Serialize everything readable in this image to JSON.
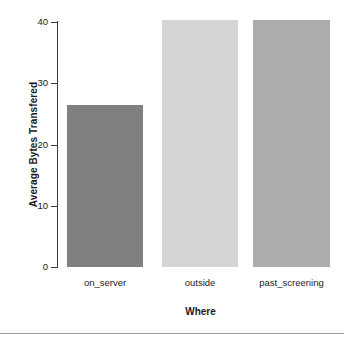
{
  "chart_data": {
    "type": "bar",
    "title": "",
    "subtitle": "",
    "xlabel": "Where",
    "ylabel": "Average Bytes Transfered",
    "categories": [
      "on_server",
      "outside",
      "past_screening"
    ],
    "values": [
      26.5,
      40.4,
      40.4
    ],
    "series": [
      {
        "name": "Average Bytes Transfered",
        "values": [
          26.5,
          40.4,
          40.4
        ]
      }
    ],
    "bar_colors": [
      "#808080",
      "#d5d5d5",
      "#acacac"
    ],
    "ylim": [
      0,
      40
    ],
    "y_ticks": [
      0,
      10,
      20,
      30,
      40
    ],
    "y_tick_labels": [
      "0",
      "10",
      "20",
      "30",
      "40"
    ],
    "x_tick_labels": [
      "on_server",
      "outside",
      "past_screening"
    ],
    "grid": false,
    "legend": false,
    "legend_position": "none",
    "background_color": "#ffffff",
    "axis_color": "#3a3a3a",
    "text_color": "#1a1a1a"
  },
  "footer": {
    "divider_color": "#9a9a9a"
  }
}
